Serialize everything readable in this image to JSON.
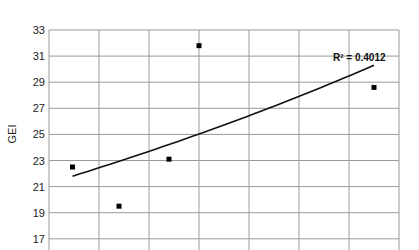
{
  "chart_data": {
    "type": "scatter",
    "title": "",
    "xlabel": "",
    "ylabel": "GEI",
    "ylim": [
      17,
      33
    ],
    "yticks": [
      17,
      19,
      21,
      23,
      25,
      27,
      29,
      31,
      33
    ],
    "grid": true,
    "x_gridlines": 7,
    "series": [
      {
        "name": "GEI",
        "marker": "square",
        "color": "#000000",
        "points": [
          {
            "xpos": 0.47,
            "y": 22.5
          },
          {
            "xpos": 1.4,
            "y": 19.5
          },
          {
            "xpos": 2.4,
            "y": 23.1
          },
          {
            "xpos": 3.0,
            "y": 31.8
          },
          {
            "xpos": 6.5,
            "y": 28.6
          }
        ]
      }
    ],
    "trendline": {
      "type": "exponential",
      "start": {
        "xpos": 0.47,
        "y": 21.8
      },
      "end": {
        "xpos": 6.5,
        "y": 30.3
      },
      "label": "R² = 0.4012"
    }
  }
}
